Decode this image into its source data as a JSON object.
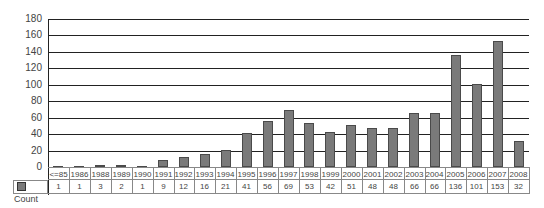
{
  "chart_data": {
    "type": "bar",
    "title": "",
    "xlabel": "",
    "ylabel": "",
    "ylim": [
      0,
      180
    ],
    "yticks": [
      0,
      20,
      40,
      60,
      80,
      100,
      120,
      140,
      160,
      180
    ],
    "grid": true,
    "legend_position": "data-table-left",
    "categories": [
      "<=85",
      "1986",
      "1988",
      "1989",
      "1990",
      "1991",
      "1992",
      "1993",
      "1994",
      "1995",
      "1996",
      "1997",
      "1998",
      "1999",
      "2000",
      "2001",
      "2002",
      "2003",
      "2004",
      "2005",
      "2006",
      "2007",
      "2008"
    ],
    "series": [
      {
        "name": "Count",
        "color": "#7a7a7a",
        "values": [
          1,
          1,
          3,
          2,
          1,
          9,
          12,
          16,
          21,
          41,
          56,
          69,
          53,
          42,
          51,
          48,
          48,
          66,
          66,
          136,
          101,
          153,
          32
        ]
      }
    ]
  },
  "table": {
    "legend_label": "Count"
  }
}
